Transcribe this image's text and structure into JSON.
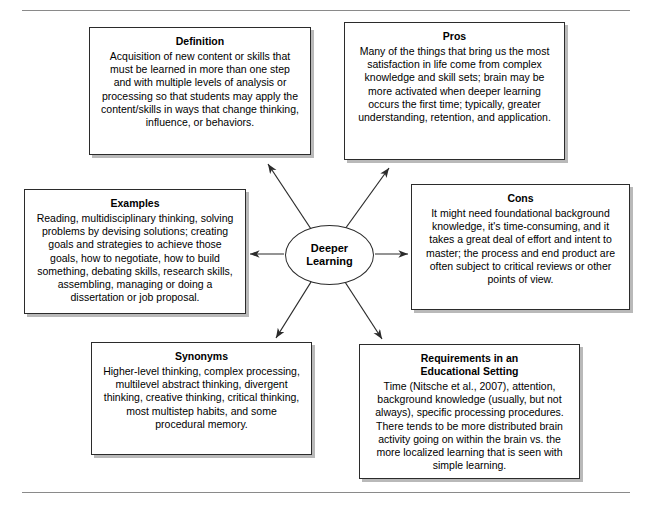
{
  "figure": {
    "center": {
      "label": "Deeper\nLearning"
    },
    "rules": {
      "top": "horizontal-rule-top",
      "bottom": "horizontal-rule-bottom"
    },
    "nodes": [
      {
        "key": "definition",
        "title": "Definition",
        "body": "Acquisition of new content or skills that must be learned in more than one step and with multiple levels of analysis or processing so that students may apply the content/skills in ways that change thinking, influence, or behaviors."
      },
      {
        "key": "pros",
        "title": "Pros",
        "body": "Many of the things that bring us the most satisfaction in life come from complex knowledge and skill sets; brain may be more activated when deeper learning occurs the first time; typically, greater understanding, retention, and application."
      },
      {
        "key": "examples",
        "title": "Examples",
        "body": "Reading, multidisciplinary thinking, solving problems by devising solutions; creating goals and strategies to achieve those goals, how to negotiate, how to build something, debating skills, research skills, assembling, managing or doing a dissertation or job proposal."
      },
      {
        "key": "cons",
        "title": "Cons",
        "body": "It might need foundational background knowledge, it's time-consuming, and it takes a great deal of effort and intent to master; the process and end product are often subject to critical reviews or other points of view."
      },
      {
        "key": "synonyms",
        "title": "Synonyms",
        "body": "Higher-level thinking, complex processing, multilevel abstract thinking, divergent thinking, creative thinking, critical thinking, most multistep habits, and some procedural memory."
      },
      {
        "key": "requirements",
        "title": "Requirements in an\nEducational Setting",
        "body": "Time (Nitsche et al., 2007), attention, background knowledge (usually, but not always), specific processing procedures. There tends to be more distributed brain activity going on within the brain vs. the more localized learning that is seen with simple learning."
      }
    ],
    "connectors": [
      {
        "name": "arrow-to-definition"
      },
      {
        "name": "arrow-to-pros"
      },
      {
        "name": "arrow-to-examples"
      },
      {
        "name": "arrow-to-cons"
      },
      {
        "name": "arrow-to-synonyms"
      },
      {
        "name": "arrow-to-requirements"
      }
    ],
    "colors": {
      "box_border": "#2b2b2b",
      "box_shadow": "#b9b9b9",
      "rule": "#8a8a8a",
      "connector": "#2b2b2b",
      "background": "#ffffff",
      "text": "#000000"
    }
  }
}
